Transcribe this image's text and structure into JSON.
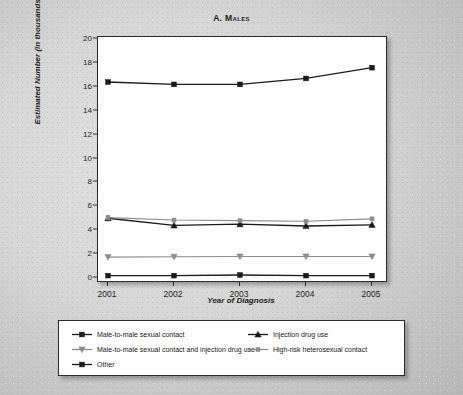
{
  "chart_data": {
    "type": "line",
    "title": "A. Males",
    "xlabel": "Year of Diagnosis",
    "ylabel": "Estimated Number (in thousands)",
    "categories": [
      "2001",
      "2002",
      "2003",
      "2004",
      "2005"
    ],
    "x_tick_labels": [
      "2001",
      "2002",
      "2003",
      "2004",
      "2005"
    ],
    "y_tick_labels": [
      "0",
      "2",
      "4",
      "6",
      "8",
      "10",
      "12",
      "14",
      "16",
      "18",
      "20"
    ],
    "y_tick_values": [
      0,
      2,
      4,
      6,
      8,
      10,
      12,
      14,
      16,
      18,
      20
    ],
    "ylim": [
      0,
      20
    ],
    "grid": false,
    "legend_position": "bottom",
    "series": [
      {
        "name": "Male-to-male sexual contact",
        "marker": "square",
        "color": "#1a1a1a",
        "values": [
          16.4,
          16.2,
          16.2,
          16.7,
          17.6
        ]
      },
      {
        "name": "Injection drug use",
        "marker": "triangle-up",
        "color": "#1a1a1a",
        "values": [
          5.0,
          4.4,
          4.5,
          4.35,
          4.45
        ]
      },
      {
        "name": "Male-to-male sexual contact and injection drug use",
        "marker": "triangle-down",
        "color": "#8c8c8c",
        "values": [
          1.75,
          1.78,
          1.8,
          1.8,
          1.8
        ]
      },
      {
        "name": "High-risk heterosexual contact",
        "marker": "square-small",
        "color": "#8c8c8c",
        "values": [
          5.05,
          4.85,
          4.8,
          4.75,
          4.95
        ]
      },
      {
        "name": "Other",
        "marker": "square",
        "color": "#1a1a1a",
        "values": [
          0.2,
          0.2,
          0.25,
          0.2,
          0.2
        ]
      }
    ]
  },
  "legend": {
    "items": [
      {
        "label": "Male-to-male sexual contact",
        "marker": "square",
        "color": "#1a1a1a",
        "column": 0,
        "row": 0
      },
      {
        "label": "Male-to-male sexual contact and injection drug use",
        "marker": "triangle-down",
        "color": "#8c8c8c",
        "column": 0,
        "row": 1
      },
      {
        "label": "Other",
        "marker": "square",
        "color": "#1a1a1a",
        "column": 0,
        "row": 2
      },
      {
        "label": "Injection drug use",
        "marker": "triangle-up",
        "color": "#1a1a1a",
        "column": 1,
        "row": 0
      },
      {
        "label": "High-risk heterosexual contact",
        "marker": "square-small",
        "color": "#8c8c8c",
        "column": 1,
        "row": 1
      }
    ]
  },
  "colors": {
    "dark": "#1a1a1a",
    "gray": "#8c8c8c",
    "axis": "#2b2b2b",
    "plot_background": "#fdfdfd",
    "page_background": "#d4d4d4"
  }
}
